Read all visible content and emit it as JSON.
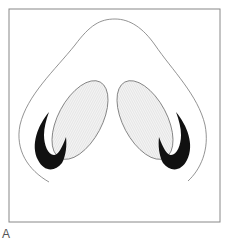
{
  "figure": {
    "panel_label": "A",
    "colors": {
      "frame": "#888888",
      "outline": "#777777",
      "nostril_fill": "#f0f0f0",
      "cartilage_fill": "#111111"
    }
  }
}
